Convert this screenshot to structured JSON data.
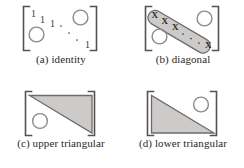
{
  "figure": {
    "name": "matrix-structure-figure",
    "background_color": "#ffffff",
    "ink_color": "#231f20",
    "fill_gray": "#cccbc9",
    "stroke_gray": "#6e6c6a",
    "panels": [
      {
        "id": "a",
        "caption": "(a) identity",
        "structure": "identity",
        "bracket": "square",
        "entries": [
          "1",
          "1",
          "1",
          "1"
        ],
        "ellipsis": "⋱",
        "zero_markers": [
          "O",
          "O"
        ],
        "zero_marker_shape": "circle"
      },
      {
        "id": "b",
        "caption": "(b) diagonal",
        "structure": "diagonal",
        "bracket": "square",
        "entries": [
          "X",
          "X",
          "X",
          "X"
        ],
        "ellipsis": "· · ·",
        "band_fill": "#cccbc9",
        "zero_markers": [
          "O",
          "O"
        ],
        "zero_marker_shape": "circle"
      },
      {
        "id": "c",
        "caption": "(c) upper triangular",
        "structure": "upper-triangular",
        "bracket": "square",
        "region_fill": "#cccbc9",
        "zero_markers": [
          "O"
        ],
        "zero_marker_shape": "circle"
      },
      {
        "id": "d",
        "caption": "(d) lower triangular",
        "structure": "lower-triangular",
        "bracket": "square",
        "region_fill": "#cccbc9",
        "zero_markers": [
          "O"
        ],
        "zero_marker_shape": "circle"
      }
    ]
  }
}
